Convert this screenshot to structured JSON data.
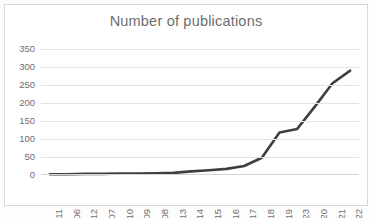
{
  "chart": {
    "title": "Number of publications",
    "title_color": "#6e6e6e",
    "line_color": "#3f3f3f",
    "gridline_color": "#e2e2e2",
    "plot_background": "#ffffff",
    "frame_border_color": "#d8d8d8"
  },
  "chart_data": {
    "type": "line",
    "title": "Number of publications",
    "xlabel": "",
    "ylabel": "",
    "ylim": [
      0,
      350
    ],
    "yticks": [
      0,
      50,
      100,
      150,
      200,
      250,
      300,
      350
    ],
    "grid": true,
    "legend": false,
    "categories": [
      "2011",
      "2006",
      "2012",
      "2007",
      "2010",
      "2009",
      "2008",
      "2013",
      "2014",
      "2015",
      "2016",
      "2017",
      "2018",
      "2019",
      "2023",
      "2020",
      "2021",
      "2022"
    ],
    "values": [
      2,
      2,
      3,
      3,
      4,
      4,
      5,
      6,
      10,
      13,
      17,
      25,
      48,
      118,
      128,
      190,
      255,
      290
    ],
    "series": [
      {
        "name": "Number of publications",
        "values": [
          2,
          2,
          3,
          3,
          4,
          4,
          5,
          6,
          10,
          13,
          17,
          25,
          48,
          118,
          128,
          190,
          255,
          290
        ]
      }
    ]
  }
}
